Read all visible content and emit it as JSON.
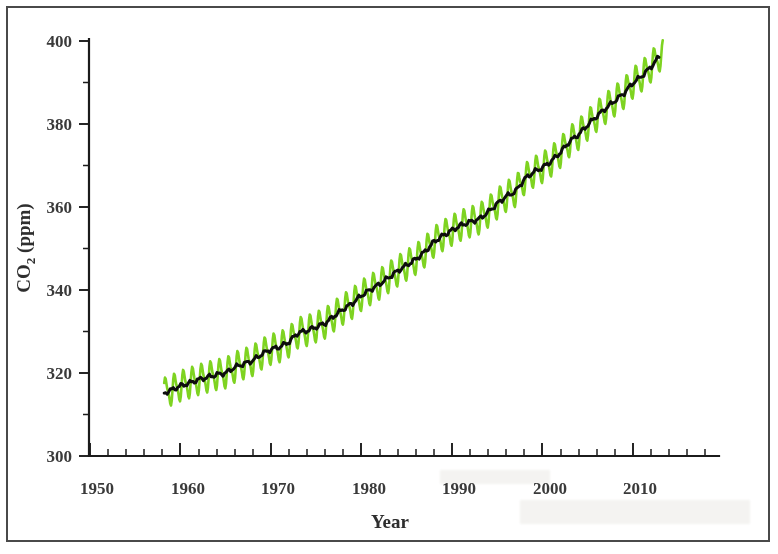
{
  "figure": {
    "background_color": "#ffffff",
    "border_color": "#4a4a4a"
  },
  "chart_data": {
    "type": "line",
    "title": "",
    "xlabel": "Year",
    "ylabel": "CO2 (ppm)",
    "ylabel_base": "CO",
    "ylabel_sub": "2",
    "ylabel_unit": " (ppm)",
    "xlim": [
      1950,
      2018
    ],
    "ylim": [
      300,
      400
    ],
    "grid": false,
    "legend": "none",
    "x_ticks": [
      1950,
      1960,
      1970,
      1980,
      1990,
      2000,
      2010
    ],
    "x_tick_labels": [
      "1950",
      "1960",
      "1970",
      "1980",
      "1990",
      "2000",
      "2010"
    ],
    "x_minor_tick_interval": 2,
    "y_ticks": [
      300,
      320,
      340,
      360,
      380,
      400
    ],
    "y_tick_labels": [
      "300",
      "320",
      "340",
      "360",
      "380",
      "400"
    ],
    "y_minor_tick_interval": 10,
    "series": [
      {
        "name": "Monthly mean CO2",
        "color": "#7ed321",
        "style": "seasonal-sawtooth",
        "seasonal_amplitude_ppm": 3.2,
        "x_start": 1958.2,
        "x_end": 2013.3
      },
      {
        "name": "Smoothed trend",
        "color": "#0d0d0d",
        "style": "annual-trend",
        "x_start": 1958.2,
        "x_end": 2012.9
      }
    ],
    "x": [
      1958,
      1959,
      1960,
      1961,
      1962,
      1963,
      1964,
      1965,
      1966,
      1967,
      1968,
      1969,
      1970,
      1971,
      1972,
      1973,
      1974,
      1975,
      1976,
      1977,
      1978,
      1979,
      1980,
      1981,
      1982,
      1983,
      1984,
      1985,
      1986,
      1987,
      1988,
      1989,
      1990,
      1991,
      1992,
      1993,
      1994,
      1995,
      1996,
      1997,
      1998,
      1999,
      2000,
      2001,
      2002,
      2003,
      2004,
      2005,
      2006,
      2007,
      2008,
      2009,
      2010,
      2011,
      2012,
      2013
    ],
    "values": [
      315.0,
      315.9,
      316.9,
      317.6,
      318.4,
      319.0,
      319.6,
      320.0,
      321.4,
      322.2,
      323.0,
      324.6,
      325.7,
      326.3,
      327.5,
      329.7,
      330.2,
      331.1,
      332.0,
      333.8,
      335.4,
      336.8,
      338.7,
      340.1,
      341.4,
      343.0,
      344.6,
      346.0,
      347.4,
      349.2,
      351.6,
      353.1,
      354.4,
      355.6,
      356.4,
      357.1,
      358.8,
      360.8,
      362.6,
      363.7,
      366.7,
      368.4,
      369.5,
      371.1,
      373.2,
      375.8,
      377.5,
      379.8,
      381.9,
      383.8,
      385.6,
      387.4,
      389.9,
      391.6,
      393.8,
      396.5
    ],
    "annotations": []
  }
}
